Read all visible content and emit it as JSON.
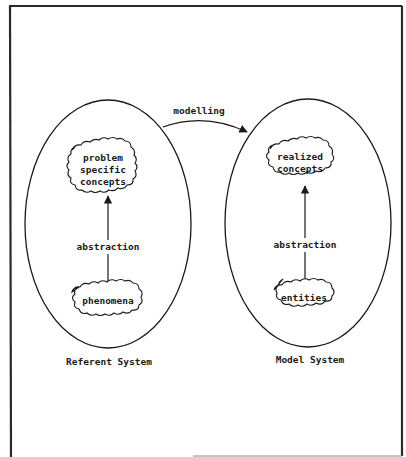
{
  "diagram": {
    "relation_label": "modelling",
    "referent_system": {
      "title": "Referent System",
      "upper_concept": [
        "problem",
        "specific",
        "concepts"
      ],
      "lower_concept": "phenomena",
      "edge_label": "abstraction"
    },
    "model_system": {
      "title": "Model System",
      "upper_concept": [
        "realized",
        "concepts"
      ],
      "lower_concept": "entities",
      "edge_label": "abstraction"
    }
  },
  "colors": {
    "ink": "#1a1a1a",
    "frame": "#2a2a2a",
    "background": "#ffffff"
  }
}
